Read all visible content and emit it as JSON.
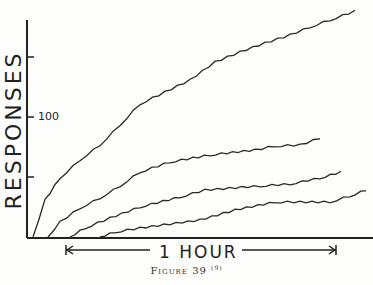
{
  "chart_data": {
    "type": "line",
    "title": "",
    "xlabel": "1 HOUR",
    "ylabel": "RESPONSES",
    "y_tick_labels": [
      "100"
    ],
    "y_ticks": [
      50,
      100,
      150
    ],
    "ylim": [
      0,
      190
    ],
    "grid": false,
    "legend": null,
    "annotation": "1 HOUR (arrow indicating one hour span)",
    "caption": "Figure 39",
    "caption_ref": "(9)",
    "series": [
      {
        "name": "curve-1",
        "points_px": [
          [
            33,
            237
          ],
          [
            45,
            200
          ],
          [
            60,
            178
          ],
          [
            80,
            160
          ],
          [
            100,
            145
          ],
          [
            120,
            125
          ],
          [
            140,
            104
          ],
          [
            165,
            92
          ],
          [
            190,
            80
          ],
          [
            215,
            62
          ],
          [
            240,
            52
          ],
          [
            265,
            43
          ],
          [
            290,
            35
          ],
          [
            310,
            27
          ],
          [
            330,
            20
          ],
          [
            355,
            11
          ]
        ]
      },
      {
        "name": "curve-2",
        "points_px": [
          [
            48,
            237
          ],
          [
            60,
            222
          ],
          [
            80,
            208
          ],
          [
            100,
            198
          ],
          [
            120,
            186
          ],
          [
            140,
            172
          ],
          [
            170,
            162
          ],
          [
            210,
            155
          ],
          [
            255,
            150
          ],
          [
            275,
            146
          ],
          [
            300,
            145
          ],
          [
            320,
            138
          ]
        ]
      },
      {
        "name": "curve-3",
        "points_px": [
          [
            70,
            237
          ],
          [
            85,
            228
          ],
          [
            110,
            218
          ],
          [
            140,
            207
          ],
          [
            180,
            197
          ],
          [
            205,
            190
          ],
          [
            260,
            186
          ],
          [
            290,
            184
          ],
          [
            320,
            178
          ],
          [
            341,
            172
          ]
        ]
      },
      {
        "name": "curve-4",
        "points_px": [
          [
            100,
            237
          ],
          [
            115,
            232
          ],
          [
            140,
            228
          ],
          [
            200,
            220
          ],
          [
            235,
            210
          ],
          [
            275,
            202
          ],
          [
            300,
            202
          ],
          [
            330,
            202
          ],
          [
            350,
            196
          ],
          [
            366,
            190
          ]
        ]
      }
    ]
  },
  "labels": {
    "ylabel": "RESPONSES",
    "tick_100": "100",
    "xlabel": "1 HOUR",
    "caption": "Figure 39",
    "caption_ref": "(9)"
  }
}
